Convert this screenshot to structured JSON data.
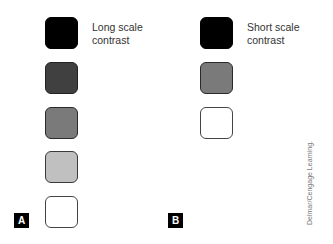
{
  "panels": [
    {
      "label": "A",
      "caption_line1": "Long scale",
      "caption_line2": "contrast",
      "swatches": [
        {
          "color": "#000000",
          "border": "#000000"
        },
        {
          "color": "#404040",
          "border": "#222222"
        },
        {
          "color": "#7a7a7a",
          "border": "#2a2a2a"
        },
        {
          "color": "#c0c0c0",
          "border": "#3a3a3a"
        },
        {
          "color": "#ffffff",
          "border": "#444444"
        }
      ]
    },
    {
      "label": "B",
      "caption_line1": "Short scale",
      "caption_line2": "contrast",
      "swatches": [
        {
          "color": "#000000",
          "border": "#000000"
        },
        {
          "color": "#7a7a7a",
          "border": "#2a2a2a"
        },
        {
          "color": "#ffffff",
          "border": "#444444"
        }
      ]
    }
  ],
  "credit": "Delmar/Cengage Learning."
}
